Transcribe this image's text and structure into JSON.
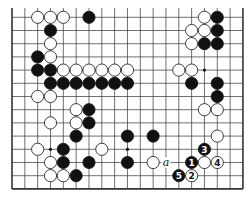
{
  "diagram": {
    "type": "go-board-fragment",
    "columns": 19,
    "rows_shown": 14,
    "edges": {
      "left": true,
      "right": true,
      "bottom": true,
      "top": false
    },
    "star_points": [
      [
        3,
        10
      ],
      [
        9,
        10
      ],
      [
        15,
        4
      ]
    ],
    "stones": [
      {
        "c": 2,
        "r": 0,
        "color": "white"
      },
      {
        "c": 3,
        "r": 0,
        "color": "white"
      },
      {
        "c": 4,
        "r": 0,
        "color": "white"
      },
      {
        "c": 6,
        "r": 0,
        "color": "black"
      },
      {
        "c": 15,
        "r": 0,
        "color": "white"
      },
      {
        "c": 16,
        "r": 0,
        "color": "black"
      },
      {
        "c": 3,
        "r": 1,
        "color": "black"
      },
      {
        "c": 14,
        "r": 1,
        "color": "white"
      },
      {
        "c": 15,
        "r": 1,
        "color": "white"
      },
      {
        "c": 16,
        "r": 1,
        "color": "black"
      },
      {
        "c": 3,
        "r": 2,
        "color": "white"
      },
      {
        "c": 14,
        "r": 2,
        "color": "white"
      },
      {
        "c": 15,
        "r": 2,
        "color": "black"
      },
      {
        "c": 16,
        "r": 2,
        "color": "black"
      },
      {
        "c": 2,
        "r": 3,
        "color": "black"
      },
      {
        "c": 3,
        "r": 3,
        "color": "white"
      },
      {
        "c": 2,
        "r": 4,
        "color": "black"
      },
      {
        "c": 3,
        "r": 4,
        "color": "black"
      },
      {
        "c": 4,
        "r": 4,
        "color": "white"
      },
      {
        "c": 5,
        "r": 4,
        "color": "white"
      },
      {
        "c": 6,
        "r": 4,
        "color": "white"
      },
      {
        "c": 7,
        "r": 4,
        "color": "white"
      },
      {
        "c": 8,
        "r": 4,
        "color": "white"
      },
      {
        "c": 9,
        "r": 4,
        "color": "white"
      },
      {
        "c": 13,
        "r": 4,
        "color": "white"
      },
      {
        "c": 14,
        "r": 4,
        "color": "white"
      },
      {
        "c": 3,
        "r": 5,
        "color": "black"
      },
      {
        "c": 4,
        "r": 5,
        "color": "black"
      },
      {
        "c": 5,
        "r": 5,
        "color": "black"
      },
      {
        "c": 6,
        "r": 5,
        "color": "black"
      },
      {
        "c": 7,
        "r": 5,
        "color": "black"
      },
      {
        "c": 8,
        "r": 5,
        "color": "black"
      },
      {
        "c": 9,
        "r": 5,
        "color": "black"
      },
      {
        "c": 14,
        "r": 5,
        "color": "black"
      },
      {
        "c": 16,
        "r": 5,
        "color": "black"
      },
      {
        "c": 2,
        "r": 6,
        "color": "white"
      },
      {
        "c": 3,
        "r": 6,
        "color": "white"
      },
      {
        "c": 16,
        "r": 6,
        "color": "black"
      },
      {
        "c": 5,
        "r": 7,
        "color": "white"
      },
      {
        "c": 6,
        "r": 7,
        "color": "black"
      },
      {
        "c": 15,
        "r": 7,
        "color": "white"
      },
      {
        "c": 16,
        "r": 7,
        "color": "white"
      },
      {
        "c": 3,
        "r": 8,
        "color": "white"
      },
      {
        "c": 5,
        "r": 8,
        "color": "white"
      },
      {
        "c": 6,
        "r": 8,
        "color": "black"
      },
      {
        "c": 5,
        "r": 9,
        "color": "black"
      },
      {
        "c": 9,
        "r": 9,
        "color": "black"
      },
      {
        "c": 11,
        "r": 9,
        "color": "black"
      },
      {
        "c": 16,
        "r": 9,
        "color": "white"
      },
      {
        "c": 2,
        "r": 10,
        "color": "white"
      },
      {
        "c": 4,
        "r": 10,
        "color": "black"
      },
      {
        "c": 7,
        "r": 10,
        "color": "white"
      },
      {
        "c": 15,
        "r": 10,
        "color": "black",
        "label": "3"
      },
      {
        "c": 3,
        "r": 11,
        "color": "white"
      },
      {
        "c": 4,
        "r": 11,
        "color": "black"
      },
      {
        "c": 6,
        "r": 11,
        "color": "black"
      },
      {
        "c": 9,
        "r": 11,
        "color": "black"
      },
      {
        "c": 11,
        "r": 11,
        "color": "white"
      },
      {
        "c": 14,
        "r": 11,
        "color": "black",
        "label": "1"
      },
      {
        "c": 15,
        "r": 11,
        "color": "white"
      },
      {
        "c": 16,
        "r": 11,
        "color": "white",
        "label": "4"
      },
      {
        "c": 3,
        "r": 12,
        "color": "white"
      },
      {
        "c": 4,
        "r": 12,
        "color": "white"
      },
      {
        "c": 5,
        "r": 12,
        "color": "black"
      },
      {
        "c": 13,
        "r": 12,
        "color": "black",
        "label": "5"
      },
      {
        "c": 14,
        "r": 12,
        "color": "white",
        "label": "2"
      }
    ],
    "point_labels": [
      {
        "c": 12,
        "r": 11,
        "text": "a"
      }
    ],
    "colors": {
      "black_stone": "#111111",
      "white_stone": "#ffffff",
      "line": "#333333",
      "background": "#ffffff"
    }
  }
}
